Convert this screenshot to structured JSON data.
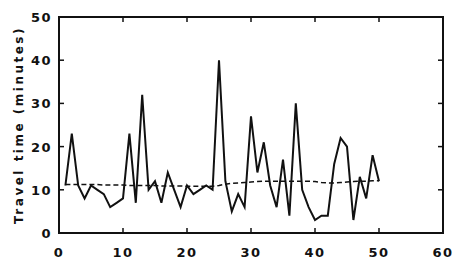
{
  "chart_data": {
    "type": "line",
    "title": "",
    "xlabel": "",
    "ylabel": "Travel time (minutes)",
    "xlim": [
      0,
      60
    ],
    "ylim": [
      0,
      50
    ],
    "xticks": [
      0,
      10,
      20,
      30,
      40,
      50,
      60
    ],
    "yticks": [
      0,
      10,
      20,
      30,
      40,
      50
    ],
    "grid": false,
    "legend": null,
    "x": [
      1,
      2,
      3,
      4,
      5,
      6,
      7,
      8,
      9,
      10,
      11,
      12,
      13,
      14,
      15,
      16,
      17,
      18,
      19,
      20,
      21,
      22,
      23,
      24,
      25,
      26,
      27,
      28,
      29,
      30,
      31,
      32,
      33,
      34,
      35,
      36,
      37,
      38,
      39,
      40,
      41,
      42,
      43,
      44,
      45,
      46,
      47,
      48,
      49,
      50
    ],
    "series": [
      {
        "name": "Observed travel time",
        "style": "solid",
        "values": [
          11,
          23,
          11,
          8,
          11,
          10,
          9,
          6,
          7,
          8,
          23,
          7,
          32,
          10,
          12,
          7,
          14,
          10,
          6,
          11,
          9,
          10,
          11,
          10,
          40,
          12,
          5,
          9,
          6,
          27,
          14,
          21,
          11,
          6,
          17,
          4,
          30,
          10,
          6,
          3,
          4,
          4,
          16,
          22,
          20,
          3,
          13,
          8,
          18,
          12
        ]
      },
      {
        "name": "Smoothed / mean travel time",
        "style": "dashed",
        "values": [
          11.2,
          11.2,
          11.2,
          11.2,
          11.2,
          11.2,
          11.1,
          11.1,
          11.1,
          11.1,
          11.0,
          11.0,
          11.0,
          11.0,
          11.0,
          10.9,
          10.9,
          10.9,
          10.9,
          10.8,
          10.8,
          10.8,
          10.8,
          10.8,
          11.0,
          11.3,
          11.5,
          11.6,
          11.7,
          11.8,
          11.9,
          12.0,
          12.0,
          12.0,
          12.0,
          12.0,
          12.0,
          12.0,
          12.0,
          11.9,
          11.7,
          11.6,
          11.6,
          11.7,
          11.8,
          11.9,
          12.0,
          12.0,
          12.1,
          12.1
        ]
      }
    ]
  },
  "axis": {
    "y_title": "Travel time (minutes)",
    "x_tick_labels": [
      "0",
      "10",
      "20",
      "30",
      "40",
      "50",
      "60"
    ],
    "y_tick_labels": [
      "0",
      "10",
      "20",
      "30",
      "40",
      "50"
    ]
  }
}
